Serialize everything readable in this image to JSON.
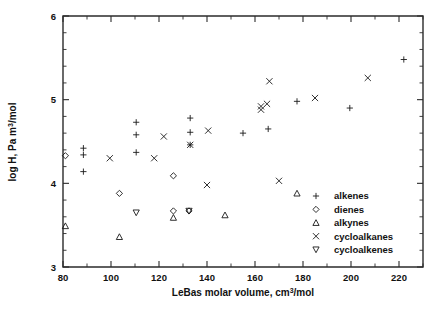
{
  "chart_data": {
    "type": "scatter",
    "title": "",
    "xlabel": "LeBas molar volume, cm3 /mol",
    "xlabel_main": "LeBas molar volume, cm",
    "xlabel_sup": "3",
    "xlabel_tail": "/mol",
    "ylabel": "log H, Pa m3 /mol",
    "ylabel_main": "log H, Pa m",
    "ylabel_sup": "3",
    "ylabel_tail": "/mol",
    "xlim": [
      80,
      230
    ],
    "ylim": [
      3,
      6
    ],
    "xticks": [
      80,
      100,
      120,
      140,
      160,
      180,
      200,
      220
    ],
    "xticklabels": [
      "80",
      "100",
      "120",
      "140",
      "160",
      "180",
      "200",
      "220"
    ],
    "xminor_step": 10,
    "yticks": [
      3,
      4,
      5,
      6
    ],
    "yticklabels": [
      "3",
      "4",
      "5",
      "6"
    ],
    "yminor_step": 0.2,
    "grid": false,
    "legend_position": "lower-right",
    "marker_color": "#1a1a1a",
    "series": [
      {
        "name": "alkenes",
        "marker": "plus",
        "points": [
          [
            88.5,
            4.42
          ],
          [
            88.5,
            4.34
          ],
          [
            88.5,
            4.14
          ],
          [
            110.5,
            4.73
          ],
          [
            110.5,
            4.58
          ],
          [
            110.5,
            4.37
          ],
          [
            133.0,
            4.78
          ],
          [
            133.0,
            4.61
          ],
          [
            133.0,
            4.46
          ],
          [
            155.0,
            4.6
          ],
          [
            165.5,
            4.65
          ],
          [
            177.5,
            4.98
          ],
          [
            199.5,
            4.9
          ],
          [
            222.0,
            5.48
          ]
        ]
      },
      {
        "name": "dienes",
        "marker": "diamond",
        "points": [
          [
            81.0,
            4.33
          ],
          [
            103.5,
            3.88
          ],
          [
            126.0,
            4.09
          ],
          [
            126.0,
            3.67
          ],
          [
            132.5,
            3.67
          ]
        ]
      },
      {
        "name": "alkynes",
        "marker": "triangle-up",
        "points": [
          [
            81.0,
            3.49
          ],
          [
            103.5,
            3.36
          ],
          [
            126.0,
            3.59
          ],
          [
            147.5,
            3.62
          ],
          [
            177.5,
            3.88
          ]
        ]
      },
      {
        "name": "cycloalkanes",
        "marker": "cross",
        "points": [
          [
            99.5,
            4.3
          ],
          [
            118.0,
            4.3
          ],
          [
            122.0,
            4.56
          ],
          [
            133.0,
            4.46
          ],
          [
            140.5,
            4.63
          ],
          [
            140.0,
            3.98
          ],
          [
            162.5,
            4.92
          ],
          [
            162.5,
            4.88
          ],
          [
            165.0,
            4.95
          ],
          [
            166.0,
            5.22
          ],
          [
            170.0,
            4.03
          ],
          [
            185.0,
            5.02
          ],
          [
            207.0,
            5.26
          ]
        ]
      },
      {
        "name": "cycloalkenes",
        "marker": "triangle-down",
        "points": [
          [
            110.5,
            3.65
          ],
          [
            132.5,
            3.67
          ]
        ]
      }
    ]
  },
  "legend": {
    "entries": [
      {
        "label": "alkenes",
        "marker": "plus"
      },
      {
        "label": "dienes",
        "marker": "diamond"
      },
      {
        "label": "alkynes",
        "marker": "triangle-up"
      },
      {
        "label": "cycloalkanes",
        "marker": "cross"
      },
      {
        "label": "cycloalkenes",
        "marker": "triangle-down"
      }
    ]
  }
}
